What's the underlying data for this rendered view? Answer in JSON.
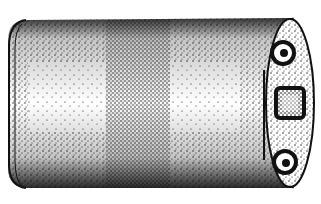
{
  "illustration": {
    "subject": "cylindrical can with end cap fittings",
    "style": "stippled black-and-white drawing",
    "colors": {
      "ink": "#111111",
      "paper": "#ffffff"
    },
    "features": [
      "cylinder-body",
      "left-rim",
      "band-middle",
      "right-end-cap",
      "top-fitting",
      "middle-nut",
      "bottom-fitting"
    ]
  }
}
